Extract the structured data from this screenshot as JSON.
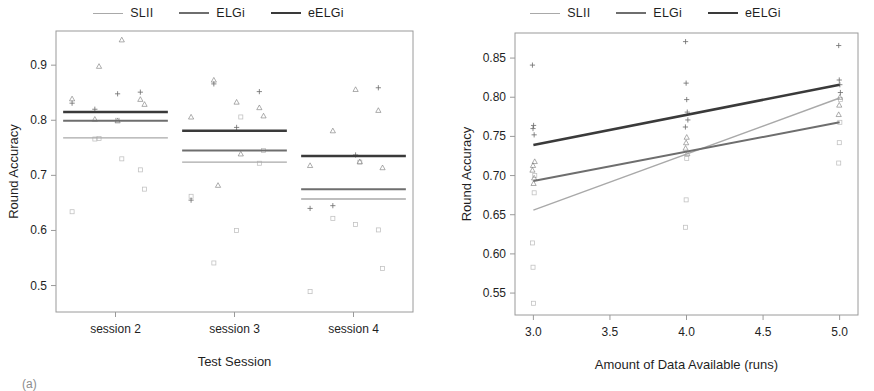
{
  "figure": {
    "caption": "(a)"
  },
  "series_colors": {
    "SLII": "#a9a9a9",
    "ELGi": "#6e6e6e",
    "eELGi": "#3a3a3a"
  },
  "legend": {
    "items": [
      {
        "label": "SLII",
        "color": "#a9a9a9",
        "width": 1.4
      },
      {
        "label": "ELGi",
        "color": "#6e6e6e",
        "width": 2.0
      },
      {
        "label": "eELGi",
        "color": "#3a3a3a",
        "width": 2.6
      }
    ]
  },
  "chart_data": [
    {
      "id": "panel-left",
      "type": "scatter",
      "title": "",
      "xlabel": "Test Session",
      "ylabel": "Round Accuracy",
      "categories": [
        "session 2",
        "session 3",
        "session 4"
      ],
      "xticklabels": [
        "session 2",
        "session 3",
        "session 4"
      ],
      "yticklabels": [
        "0.5",
        "0.6",
        "0.7",
        "0.8",
        "0.9"
      ],
      "yticks": [
        0.5,
        0.6,
        0.7,
        0.8,
        0.9
      ],
      "ylim": [
        0.452,
        0.962
      ],
      "grid": false,
      "legend_position": "top-center",
      "series": [
        {
          "name": "SLII",
          "color": "#a9a9a9",
          "group_means": [
            0.768,
            0.724,
            0.657
          ],
          "points": [
            {
              "x": "session 2",
              "y": 0.71
            },
            {
              "x": "session 2",
              "y": 0.8
            },
            {
              "x": "session 2",
              "y": 0.766
            },
            {
              "x": "session 2",
              "y": 0.634
            },
            {
              "x": "session 2",
              "y": 0.675
            },
            {
              "x": "session 2",
              "y": 0.73
            },
            {
              "x": "session 2",
              "y": 0.767
            },
            {
              "x": "session 3",
              "y": 0.722
            },
            {
              "x": "session 3",
              "y": 0.6
            },
            {
              "x": "session 3",
              "y": 0.541
            },
            {
              "x": "session 3",
              "y": 0.662
            },
            {
              "x": "session 3",
              "y": 0.745
            },
            {
              "x": "session 3",
              "y": 0.806
            },
            {
              "x": "session 4",
              "y": 0.601
            },
            {
              "x": "session 4",
              "y": 0.611
            },
            {
              "x": "session 4",
              "y": 0.622
            },
            {
              "x": "session 4",
              "y": 0.489
            },
            {
              "x": "session 4",
              "y": 0.531
            },
            {
              "x": "session 4",
              "y": 0.724
            }
          ]
        },
        {
          "name": "ELGi",
          "color": "#6e6e6e",
          "group_means": [
            0.799,
            0.745,
            0.675
          ],
          "points": [
            {
              "x": "session 2",
              "y": 0.838
            },
            {
              "x": "session 2",
              "y": 0.799
            },
            {
              "x": "session 2",
              "y": 0.802
            },
            {
              "x": "session 2",
              "y": 0.839
            },
            {
              "x": "session 2",
              "y": 0.829
            },
            {
              "x": "session 2",
              "y": 0.946
            },
            {
              "x": "session 2",
              "y": 0.898
            },
            {
              "x": "session 3",
              "y": 0.823
            },
            {
              "x": "session 3",
              "y": 0.833
            },
            {
              "x": "session 3",
              "y": 0.873
            },
            {
              "x": "session 3",
              "y": 0.806
            },
            {
              "x": "session 3",
              "y": 0.808
            },
            {
              "x": "session 3",
              "y": 0.739
            },
            {
              "x": "session 3",
              "y": 0.682
            },
            {
              "x": "session 4",
              "y": 0.818
            },
            {
              "x": "session 4",
              "y": 0.856
            },
            {
              "x": "session 4",
              "y": 0.781
            },
            {
              "x": "session 4",
              "y": 0.718
            },
            {
              "x": "session 4",
              "y": 0.714
            },
            {
              "x": "session 4",
              "y": 0.725
            }
          ]
        },
        {
          "name": "eELGi",
          "color": "#3a3a3a",
          "group_means": [
            0.815,
            0.781,
            0.735
          ],
          "points": [
            {
              "x": "session 2",
              "y": 0.851
            },
            {
              "x": "session 2",
              "y": 0.848
            },
            {
              "x": "session 2",
              "y": 0.82
            },
            {
              "x": "session 2",
              "y": 0.831
            },
            {
              "x": "session 3",
              "y": 0.852
            },
            {
              "x": "session 3",
              "y": 0.787
            },
            {
              "x": "session 3",
              "y": 0.866
            },
            {
              "x": "session 3",
              "y": 0.655
            },
            {
              "x": "session 4",
              "y": 0.859
            },
            {
              "x": "session 4",
              "y": 0.737
            },
            {
              "x": "session 4",
              "y": 0.645
            },
            {
              "x": "session 4",
              "y": 0.64
            }
          ]
        }
      ]
    },
    {
      "id": "panel-right",
      "type": "line",
      "title": "",
      "xlabel": "Amount of Data Available (runs)",
      "ylabel": "Round Accuracy",
      "xticklabels": [
        "3.0",
        "3.5",
        "4.0",
        "4.5",
        "5.0"
      ],
      "xticks": [
        3.0,
        3.5,
        4.0,
        4.5,
        5.0
      ],
      "xlim": [
        2.88,
        5.12
      ],
      "yticklabels": [
        "0.55",
        "0.60",
        "0.65",
        "0.70",
        "0.75",
        "0.80",
        "0.85"
      ],
      "yticks": [
        0.55,
        0.6,
        0.65,
        0.7,
        0.75,
        0.8,
        0.85
      ],
      "ylim": [
        0.522,
        0.882
      ],
      "grid": false,
      "legend_position": "top-center",
      "x": [
        3.0,
        5.0
      ],
      "series": [
        {
          "name": "SLII",
          "color": "#a9a9a9",
          "values": [
            0.656,
            0.799
          ],
          "points": [
            {
              "x": 3.0,
              "y": 0.614
            },
            {
              "x": 3.0,
              "y": 0.583
            },
            {
              "x": 3.0,
              "y": 0.537
            },
            {
              "x": 3.0,
              "y": 0.678
            },
            {
              "x": 3.0,
              "y": 0.7
            },
            {
              "x": 4.0,
              "y": 0.634
            },
            {
              "x": 4.0,
              "y": 0.669
            },
            {
              "x": 4.0,
              "y": 0.722
            },
            {
              "x": 5.0,
              "y": 0.716
            },
            {
              "x": 5.0,
              "y": 0.742
            },
            {
              "x": 5.0,
              "y": 0.768
            },
            {
              "x": 5.0,
              "y": 0.797
            }
          ]
        },
        {
          "name": "ELGi",
          "color": "#6e6e6e",
          "values": [
            0.693,
            0.768
          ],
          "points": [
            {
              "x": 3.0,
              "y": 0.707
            },
            {
              "x": 3.0,
              "y": 0.713
            },
            {
              "x": 3.0,
              "y": 0.69
            },
            {
              "x": 3.0,
              "y": 0.697
            },
            {
              "x": 3.0,
              "y": 0.718
            },
            {
              "x": 4.0,
              "y": 0.735
            },
            {
              "x": 4.0,
              "y": 0.742
            },
            {
              "x": 4.0,
              "y": 0.749
            },
            {
              "x": 4.0,
              "y": 0.728
            },
            {
              "x": 5.0,
              "y": 0.778
            },
            {
              "x": 5.0,
              "y": 0.79
            },
            {
              "x": 5.0,
              "y": 0.8
            }
          ]
        },
        {
          "name": "eELGi",
          "color": "#3a3a3a",
          "values": [
            0.739,
            0.816
          ],
          "points": [
            {
              "x": 3.0,
              "y": 0.841
            },
            {
              "x": 3.0,
              "y": 0.76
            },
            {
              "x": 3.0,
              "y": 0.764
            },
            {
              "x": 3.0,
              "y": 0.752
            },
            {
              "x": 4.0,
              "y": 0.871
            },
            {
              "x": 4.0,
              "y": 0.818
            },
            {
              "x": 4.0,
              "y": 0.797
            },
            {
              "x": 4.0,
              "y": 0.781
            },
            {
              "x": 4.0,
              "y": 0.771
            },
            {
              "x": 4.0,
              "y": 0.762
            },
            {
              "x": 5.0,
              "y": 0.866
            },
            {
              "x": 5.0,
              "y": 0.822
            },
            {
              "x": 5.0,
              "y": 0.816
            },
            {
              "x": 5.0,
              "y": 0.806
            }
          ]
        }
      ]
    }
  ]
}
